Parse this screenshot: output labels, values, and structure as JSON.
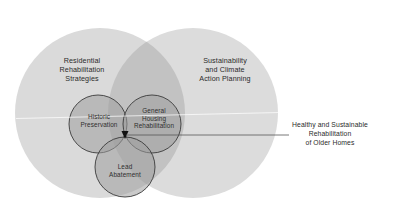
{
  "diagram": {
    "type": "venn",
    "colors": {
      "background": "#ffffff",
      "big_circle_fill": "#d9d9d9",
      "big_overlap_fill": "#c0c0c0",
      "small_circle_fill": "#a9a9a9",
      "small_circle_stroke": "#3a3a3a",
      "center_marker": "#111111",
      "pointer_line": "#555555",
      "text": "#2b2b2b"
    },
    "big_circles": [
      {
        "id": "residential",
        "label": "Residential\nRehabilitation\nStrategies"
      },
      {
        "id": "sustainability",
        "label": "Sustainability\nand Climate\nAction Planning"
      }
    ],
    "small_circles": [
      {
        "id": "historic",
        "label": "Historic\nPreservation"
      },
      {
        "id": "general-housing",
        "label": "General\nHousing\nRehabilitation"
      },
      {
        "id": "lead",
        "label": "Lead\nAbatement"
      }
    ],
    "callout": {
      "label": "Healthy and Sustainable\nRehabilitation\nof Older Homes"
    }
  }
}
